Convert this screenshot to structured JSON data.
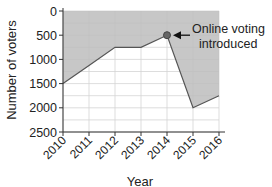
{
  "chart_data": {
    "type": "area",
    "title": "",
    "xlabel": "Year",
    "ylabel": "Number of voters",
    "categories": [
      "2010",
      "2011",
      "2012",
      "2013",
      "2014",
      "2015",
      "2016"
    ],
    "values": [
      1500,
      1125,
      750,
      750,
      500,
      2000,
      1750
    ],
    "y_ticks": [
      "0",
      "500",
      "1000",
      "1500",
      "2000",
      "2500"
    ],
    "ylim": [
      0,
      2500
    ],
    "y_inverted": true,
    "grid": true,
    "fill_color": "#bdbdbd",
    "line_color": "#555555",
    "annotation": {
      "text_line1": "Online voting",
      "text_line2": "introduced",
      "x": "2014",
      "y": 500
    }
  }
}
